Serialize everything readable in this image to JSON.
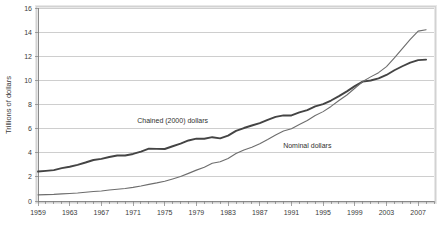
{
  "chart_data": {
    "type": "line",
    "title": "",
    "xlabel": "",
    "ylabel": "Trillions of dollars",
    "ylim": [
      0,
      16
    ],
    "xlim": [
      1959,
      2009
    ],
    "y_ticks": [
      0,
      2,
      4,
      6,
      8,
      10,
      12,
      14,
      16
    ],
    "x_ticks": [
      1959,
      1963,
      1967,
      1971,
      1975,
      1979,
      1983,
      1987,
      1991,
      1995,
      1999,
      2003,
      2007
    ],
    "x_minor_tick_step": 1,
    "grid": "horizontal",
    "legend_position": "inline-annotations",
    "x": [
      1959,
      1960,
      1961,
      1962,
      1963,
      1964,
      1965,
      1966,
      1967,
      1968,
      1969,
      1970,
      1971,
      1972,
      1973,
      1974,
      1975,
      1976,
      1977,
      1978,
      1979,
      1980,
      1981,
      1982,
      1983,
      1984,
      1985,
      1986,
      1987,
      1988,
      1989,
      1990,
      1991,
      1992,
      1993,
      1994,
      1995,
      1996,
      1997,
      1998,
      1999,
      2000,
      2001,
      2002,
      2003,
      2004,
      2005,
      2006,
      2007,
      2008
    ],
    "series": [
      {
        "name": "Chained (2000) dollars",
        "color": "#444444",
        "width": 1.9,
        "label_x": 1976,
        "label_y": 6.5,
        "values": [
          2.44,
          2.5,
          2.56,
          2.72,
          2.84,
          3.0,
          3.19,
          3.4,
          3.49,
          3.65,
          3.77,
          3.77,
          3.9,
          4.1,
          4.34,
          4.32,
          4.31,
          4.54,
          4.75,
          5.02,
          5.17,
          5.16,
          5.29,
          5.19,
          5.42,
          5.81,
          6.05,
          6.26,
          6.46,
          6.73,
          6.97,
          7.1,
          7.09,
          7.34,
          7.54,
          7.84,
          8.03,
          8.33,
          8.7,
          9.09,
          9.52,
          9.9,
          9.99,
          10.17,
          10.45,
          10.84,
          11.17,
          11.47,
          11.68,
          11.72
        ]
      },
      {
        "name": "Nominal dollars",
        "color": "#6d6d6d",
        "width": 1.1,
        "label_x": 1993,
        "label_y": 4.4,
        "values": [
          0.51,
          0.53,
          0.55,
          0.59,
          0.62,
          0.66,
          0.72,
          0.79,
          0.83,
          0.91,
          0.98,
          1.04,
          1.13,
          1.24,
          1.38,
          1.5,
          1.64,
          1.83,
          2.03,
          2.29,
          2.56,
          2.79,
          3.13,
          3.26,
          3.53,
          3.93,
          4.22,
          4.46,
          4.74,
          5.1,
          5.48,
          5.8,
          5.99,
          6.34,
          6.67,
          7.09,
          7.41,
          7.84,
          8.33,
          8.79,
          9.35,
          9.9,
          10.29,
          10.64,
          11.14,
          11.87,
          12.64,
          13.4,
          14.08,
          14.2
        ]
      }
    ]
  }
}
